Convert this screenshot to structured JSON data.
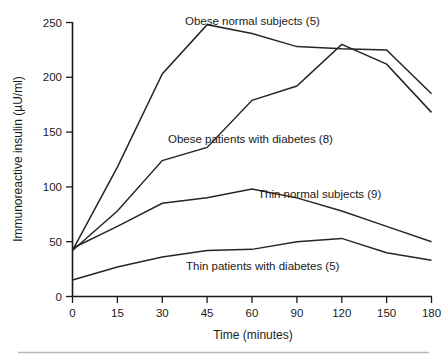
{
  "chart_data": {
    "type": "line",
    "title": "",
    "xlabel": "Time (minutes)",
    "ylabel": "Immunoreactive insulin (µU/ml)",
    "x": [
      0,
      15,
      30,
      45,
      60,
      90,
      120,
      150,
      180
    ],
    "x_tick_labels": [
      "0",
      "15",
      "30",
      "45",
      "60",
      "90",
      "120",
      "150",
      "180"
    ],
    "y_tick_labels": [
      "0",
      "50",
      "100",
      "150",
      "200",
      "250"
    ],
    "y_ticks": [
      0,
      50,
      100,
      150,
      200,
      250
    ],
    "ylim": [
      0,
      258
    ],
    "xlim": [
      0,
      180
    ],
    "x_axis_scale": "ordinal-equal-spacing",
    "grid": false,
    "legend": "inline-annotations",
    "series": [
      {
        "name": "Obese normal subjects (5)",
        "n": 5,
        "values": [
          42,
          118,
          203,
          248,
          240,
          228,
          226,
          225,
          185
        ]
      },
      {
        "name": "Obese patients with diabetes (8)",
        "n": 8,
        "values": [
          42,
          78,
          124,
          136,
          179,
          192,
          230,
          212,
          168
        ]
      },
      {
        "name": "Thin normal subjects (9)",
        "n": 9,
        "values": [
          44,
          64,
          85,
          90,
          98,
          90,
          78,
          64,
          50
        ]
      },
      {
        "name": "Thin patients with diabetes (5)",
        "n": 5,
        "values": [
          15,
          27,
          36,
          42,
          43,
          50,
          53,
          40,
          33
        ]
      }
    ],
    "annotations": [
      {
        "text": "Obese normal subjects (5)",
        "anchor_x": 185,
        "anchor_y": 25
      },
      {
        "text": "Obese patients with diabetes (8)",
        "anchor_x": 168,
        "anchor_y": 143
      },
      {
        "text": "Thin normal subjects (9)",
        "anchor_x": 258,
        "anchor_y": 198
      },
      {
        "text": "Thin patients with diabetes (5)",
        "anchor_x": 186,
        "anchor_y": 270
      }
    ],
    "colors": {
      "line": "#262626",
      "axis": "#1a1a1a",
      "text": "#1a1a1a",
      "background": "#ffffff",
      "footer_rule": "#b8b8b8"
    }
  }
}
